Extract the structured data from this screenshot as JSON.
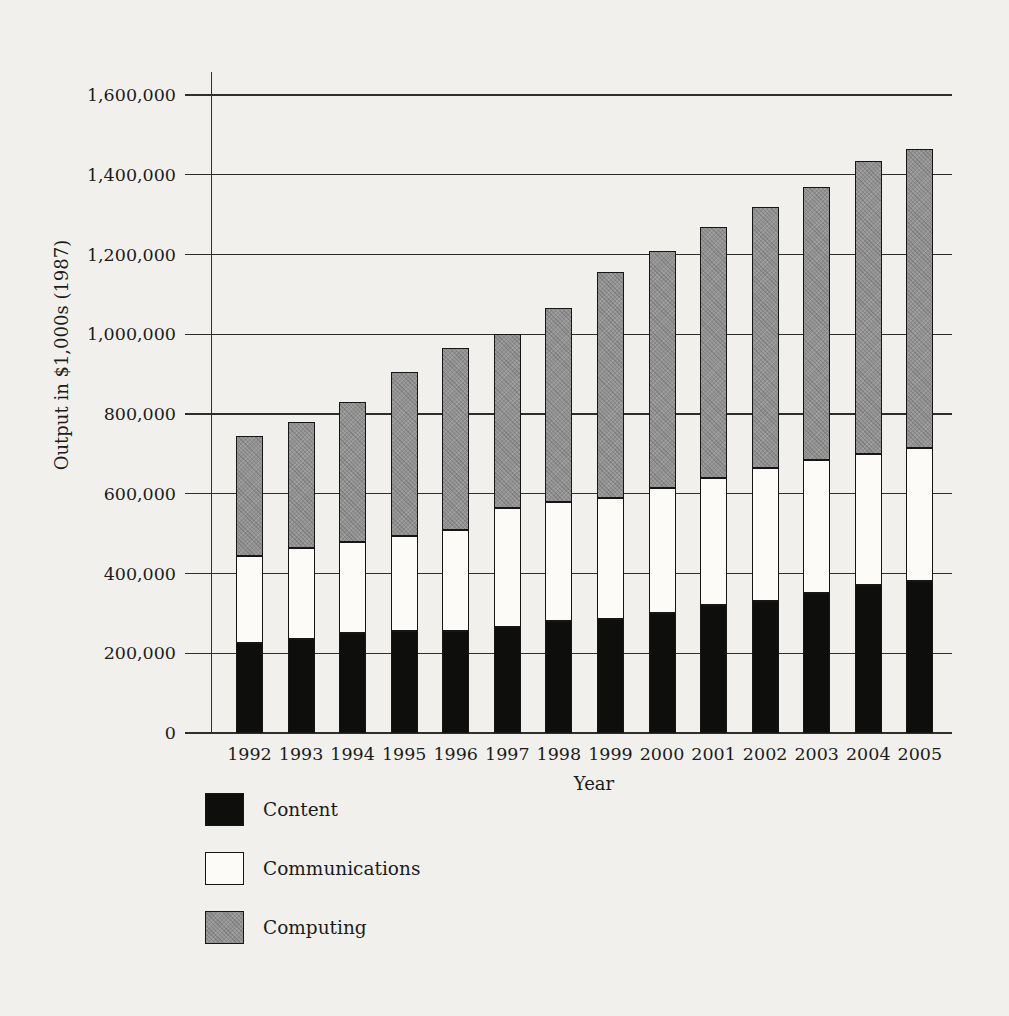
{
  "page": {
    "background": "#f1f0ec"
  },
  "chart_data": {
    "type": "bar",
    "stacked": true,
    "title": "",
    "xlabel": "Year",
    "ylabel": "Output in $1,000s (1987)",
    "categories": [
      "1992",
      "1993",
      "1994",
      "1995",
      "1996",
      "1997",
      "1998",
      "1999",
      "2000",
      "2001",
      "2002",
      "2003",
      "2004",
      "2005"
    ],
    "series": [
      {
        "key": "content",
        "name": "Content",
        "color": "#0e0e0c",
        "values": [
          225000,
          235000,
          250000,
          255000,
          255000,
          265000,
          280000,
          285000,
          300000,
          320000,
          330000,
          350000,
          370000,
          380000
        ]
      },
      {
        "key": "communications",
        "name": "Communications",
        "color": "#fcfbf8",
        "values": [
          220000,
          230000,
          230000,
          240000,
          255000,
          300000,
          300000,
          305000,
          315000,
          320000,
          335000,
          335000,
          330000,
          335000
        ]
      },
      {
        "key": "computing",
        "name": "Computing",
        "color": "#8f8f8f",
        "values": [
          300000,
          315000,
          350000,
          410000,
          455000,
          435000,
          485000,
          565000,
          595000,
          630000,
          655000,
          685000,
          735000,
          750000
        ]
      }
    ],
    "totals": [
      745000,
      780000,
      830000,
      905000,
      965000,
      1000000,
      1065000,
      1155000,
      1210000,
      1270000,
      1320000,
      1370000,
      1435000,
      1465000
    ],
    "ylim": [
      0,
      1600000
    ],
    "y_ticks": [
      0,
      200000,
      400000,
      600000,
      800000,
      1000000,
      1200000,
      1400000,
      1600000
    ],
    "y_tick_labels": [
      "0",
      "200,000",
      "400,000",
      "600,000",
      "800,000",
      "1,000,000",
      "1,200,000",
      "1,400,000",
      "1,600,000"
    ],
    "grid": true,
    "legend_position": "bottom-left"
  }
}
